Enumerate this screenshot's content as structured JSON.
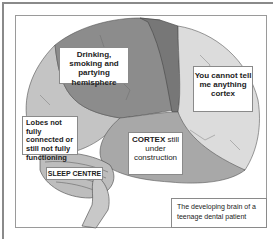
{
  "figure": {
    "colors": {
      "frontal_lobe": "#8c8c8c",
      "motor_strip": "#777777",
      "parietal_lobe": "#d9d9d9",
      "temporal_lobe": "#a8a8a8",
      "prefrontal": "#c4c4c4",
      "cerebellum": "#bdbdbd",
      "frame": "#8a8a8a"
    },
    "labels": {
      "hemisphere": "Drinking, smoking and partying hemisphere",
      "cortex_right": "You cannot tell me anything cortex",
      "lobes": "Lobes not fully connected or still not fully functioning",
      "cortex_bold": "CORTEX",
      "cortex_rest": " still under construction",
      "sleep": "SLEEP CENTRE",
      "caption": "The developing brain of a teenage dental patient"
    },
    "tiny_labels": {
      "lateral_sulcus": "lateral sulcus"
    }
  }
}
